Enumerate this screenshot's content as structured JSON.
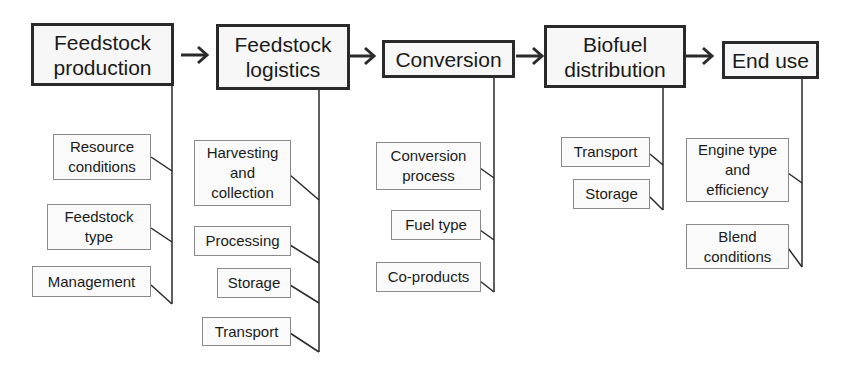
{
  "stages": [
    {
      "label": "Feedstock production",
      "items": [
        "Resource conditions",
        "Feedstock type",
        "Management"
      ]
    },
    {
      "label": "Feedstock logistics",
      "items": [
        "Harvesting and collection",
        "Processing",
        "Storage",
        "Transport"
      ]
    },
    {
      "label": "Conversion",
      "items": [
        "Conversion process",
        "Fuel type",
        "Co-products"
      ]
    },
    {
      "label": "Biofuel distribution",
      "items": [
        "Transport",
        "Storage"
      ]
    },
    {
      "label": "End use",
      "items": [
        "Engine type and efficiency",
        "Blend conditions"
      ]
    }
  ]
}
